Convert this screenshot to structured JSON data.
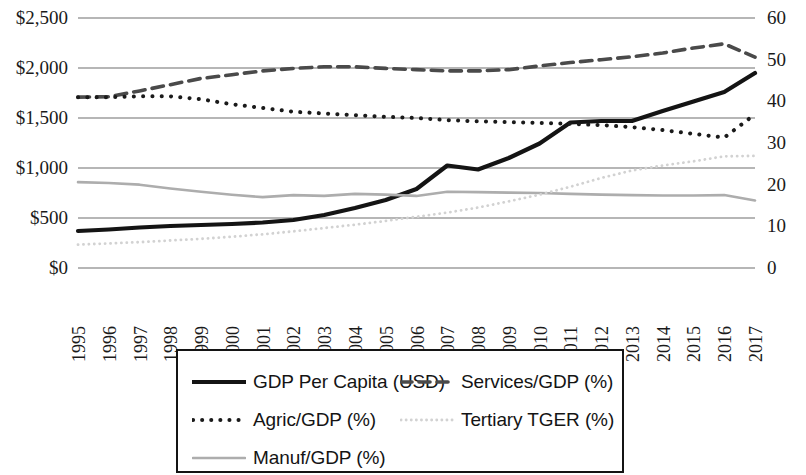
{
  "chart_data": {
    "type": "line",
    "title": "",
    "xlabel": "",
    "ylabel": "",
    "y2label": "",
    "grid": true,
    "legend_position": "bottom",
    "x": [
      1995,
      1996,
      1997,
      1998,
      1999,
      2000,
      2001,
      2002,
      2003,
      2004,
      2005,
      2006,
      2007,
      2008,
      2009,
      2010,
      2011,
      2012,
      2013,
      2014,
      2015,
      2016,
      2017
    ],
    "xtick_labels": [
      "1995",
      "1996",
      "1997",
      "1998",
      "1999",
      "2000",
      "2001",
      "2002",
      "2003",
      "2004",
      "2005",
      "2006",
      "2007",
      "2008",
      "2009",
      "2010",
      "2011",
      "2012",
      "2013",
      "2014",
      "2015",
      "2016",
      "2017"
    ],
    "yticks_left": [
      0,
      500,
      1000,
      1500,
      2000,
      2500
    ],
    "ytick_labels_left": [
      "$0",
      "$500",
      "$1,000",
      "$1,500",
      "$2,000",
      "$2,500"
    ],
    "ylim_left": [
      0,
      2500
    ],
    "yticks_right": [
      0,
      10,
      20,
      30,
      40,
      50,
      60
    ],
    "ytick_labels_right": [
      "0",
      "10",
      "20",
      "30",
      "40",
      "50",
      "60"
    ],
    "ylim_right": [
      0,
      60
    ],
    "series": [
      {
        "name": "GDP Per Capita (USD)",
        "axis": "left",
        "style": "solid",
        "color": "#141414",
        "width": 4.2,
        "values": [
          370,
          385,
          405,
          420,
          430,
          440,
          455,
          480,
          530,
          600,
          680,
          790,
          1025,
          985,
          1100,
          1245,
          1455,
          1470,
          1470,
          1570,
          1665,
          1760,
          1950
        ]
      },
      {
        "name": "Services/GDP (%)",
        "axis": "right",
        "style": "dashed",
        "color": "#4a4a4a",
        "width": 3.6,
        "values": [
          41.0,
          41.1,
          42.5,
          44.0,
          45.5,
          46.4,
          47.3,
          47.9,
          48.3,
          48.3,
          47.9,
          47.6,
          47.3,
          47.3,
          47.6,
          48.5,
          49.3,
          50.0,
          50.7,
          51.6,
          52.8,
          53.8,
          50.6
        ]
      },
      {
        "name": "Agric/GDP (%)",
        "axis": "right",
        "style": "dotted",
        "color": "#1a1a1a",
        "width": 4.0,
        "values": [
          41.0,
          41.0,
          41.2,
          41.2,
          40.5,
          39.3,
          38.4,
          37.5,
          37.1,
          36.7,
          36.3,
          36.0,
          35.5,
          35.2,
          35.0,
          34.8,
          34.6,
          34.3,
          33.8,
          33.1,
          32.2,
          31.3,
          36.9
        ]
      },
      {
        "name": "Manuf/GDP (%)",
        "axis": "right",
        "style": "solid",
        "color": "#adadad",
        "width": 2.6,
        "values": [
          20.6,
          20.4,
          20.0,
          19.1,
          18.3,
          17.6,
          17.0,
          17.5,
          17.3,
          17.8,
          17.6,
          17.3,
          18.3,
          18.2,
          18.1,
          18.0,
          17.8,
          17.6,
          17.5,
          17.4,
          17.4,
          17.5,
          16.2
        ]
      },
      {
        "name": "Tertiary TGER (%)",
        "axis": "right",
        "style": "dotted-light",
        "color": "#d2d2d2",
        "width": 2.8,
        "values": [
          5.6,
          5.9,
          6.2,
          6.6,
          7.0,
          7.5,
          8.1,
          8.8,
          9.6,
          10.4,
          11.3,
          12.3,
          13.3,
          14.5,
          16.0,
          17.6,
          19.5,
          21.6,
          23.4,
          24.6,
          25.6,
          26.8,
          26.9
        ]
      }
    ]
  },
  "legend": {
    "items": [
      {
        "label": "GDP Per Capita (USD)",
        "swatch": "solid-black-line-icon"
      },
      {
        "label": "Services/GDP (%)",
        "swatch": "dashed-gray-line-icon"
      },
      {
        "label": "Agric/GDP (%)",
        "swatch": "dotted-black-line-icon"
      },
      {
        "label": "Tertiary TGER (%)",
        "swatch": "dotted-lightgray-line-icon"
      },
      {
        "label": "Manuf/GDP (%)",
        "swatch": "solid-lightgray-line-icon"
      }
    ]
  },
  "colors": {
    "gdp": "#141414",
    "services": "#4a4a4a",
    "agric": "#1a1a1a",
    "manuf": "#adadad",
    "tertiary": "#d2d2d2",
    "grid": "#6f6f6f",
    "text": "#141414",
    "background": "#ffffff"
  }
}
